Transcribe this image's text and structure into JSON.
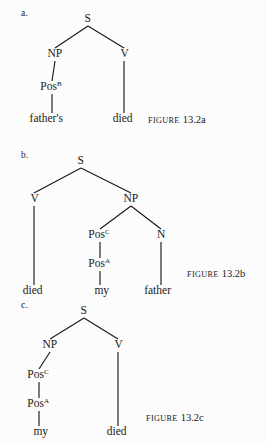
{
  "page": {
    "background_color": "#fcfcfc",
    "text_color": "#1a1a1a",
    "width": 266,
    "height": 443
  },
  "figures": [
    {
      "item_label": "a.",
      "caption_word": "Figure",
      "caption_number": "13.2a",
      "nodes": [
        {
          "id": "s_a",
          "label": "S",
          "sup": "",
          "x": 88,
          "y": 22
        },
        {
          "id": "np_a",
          "label": "NP",
          "sup": "",
          "x": 55,
          "y": 57
        },
        {
          "id": "v_a",
          "label": "V",
          "sup": "",
          "x": 124,
          "y": 57
        },
        {
          "id": "pos_a",
          "label": "Pos",
          "sup": "B",
          "x": 52,
          "y": 90
        },
        {
          "id": "leaf1",
          "label": "father's",
          "sup": "",
          "x": 52,
          "y": 122
        },
        {
          "id": "leaf2",
          "label": "died",
          "sup": "",
          "x": 124,
          "y": 122
        }
      ],
      "edges": [
        {
          "from": "s_a",
          "to": "np_a"
        },
        {
          "from": "s_a",
          "to": "v_a"
        },
        {
          "from": "np_a",
          "to": "pos_a"
        },
        {
          "from": "pos_a",
          "to": "leaf1"
        },
        {
          "from": "v_a",
          "to": "leaf2"
        }
      ]
    },
    {
      "item_label": "b.",
      "caption_word": "Figure",
      "caption_number": "13.2b",
      "nodes": [
        {
          "id": "s_b",
          "label": "S",
          "sup": "",
          "x": 81,
          "y": 22
        },
        {
          "id": "v_b",
          "label": "V",
          "sup": "",
          "x": 34,
          "y": 60
        },
        {
          "id": "np_b",
          "label": "NP",
          "sup": "",
          "x": 131,
          "y": 60
        },
        {
          "id": "posc",
          "label": "Pos",
          "sup": "C",
          "x": 100,
          "y": 96
        },
        {
          "id": "n_b",
          "label": "N",
          "sup": "",
          "x": 161,
          "y": 96
        },
        {
          "id": "posa",
          "label": "Pos",
          "sup": "A",
          "x": 100,
          "y": 125
        },
        {
          "id": "leaf3",
          "label": "died",
          "sup": "",
          "x": 34,
          "y": 152
        },
        {
          "id": "leaf4",
          "label": "my",
          "sup": "",
          "x": 100,
          "y": 152
        },
        {
          "id": "leaf5",
          "label": "father",
          "sup": "",
          "x": 161,
          "y": 152
        }
      ],
      "edges": [
        {
          "from": "s_b",
          "to": "v_b"
        },
        {
          "from": "s_b",
          "to": "np_b"
        },
        {
          "from": "np_b",
          "to": "posc"
        },
        {
          "from": "np_b",
          "to": "n_b"
        },
        {
          "from": "posc",
          "to": "posa"
        },
        {
          "from": "posa",
          "to": "leaf4"
        },
        {
          "from": "v_b",
          "to": "leaf3"
        },
        {
          "from": "n_b",
          "to": "leaf5"
        }
      ]
    },
    {
      "item_label": "c.",
      "caption_word": "Figure",
      "caption_number": "13.2c",
      "nodes": [
        {
          "id": "s_c",
          "label": "S",
          "sup": "",
          "x": 84,
          "y": 22
        },
        {
          "id": "np_c",
          "label": "NP",
          "sup": "",
          "x": 50,
          "y": 56
        },
        {
          "id": "v_c",
          "label": "V",
          "sup": "",
          "x": 118,
          "y": 56
        },
        {
          "id": "posc2",
          "label": "Pos",
          "sup": "C",
          "x": 39,
          "y": 86
        },
        {
          "id": "posa2",
          "label": "Pos",
          "sup": "A",
          "x": 39,
          "y": 115
        },
        {
          "id": "leaf6",
          "label": "my",
          "sup": "",
          "x": 39,
          "y": 143
        },
        {
          "id": "leaf7",
          "label": "died",
          "sup": "",
          "x": 118,
          "y": 143
        }
      ],
      "edges": [
        {
          "from": "s_c",
          "to": "np_c"
        },
        {
          "from": "s_c",
          "to": "v_c"
        },
        {
          "from": "np_c",
          "to": "posc2"
        },
        {
          "from": "posc2",
          "to": "posa2"
        },
        {
          "from": "posa2",
          "to": "leaf6"
        },
        {
          "from": "v_c",
          "to": "leaf7"
        }
      ]
    }
  ],
  "layout": {
    "block_tops": [
      0,
      142,
      292
    ],
    "block_heights": [
      142,
      150,
      151
    ],
    "item_label_x": 21,
    "item_label_offsets_y": [
      8,
      8,
      8
    ],
    "caption_positions": [
      {
        "x": 148,
        "y": 114
      },
      {
        "x": 187,
        "y": 268
      },
      {
        "x": 146,
        "y": 412
      }
    ]
  }
}
